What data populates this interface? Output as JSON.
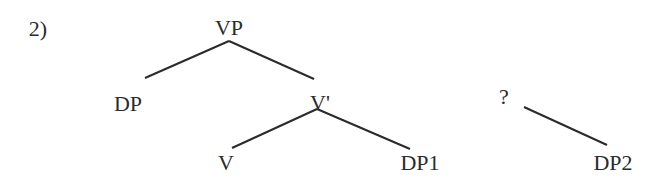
{
  "example_number": "2)",
  "tree": {
    "nodes": [
      {
        "id": "VP",
        "label": "VP",
        "x": 229,
        "y": 28
      },
      {
        "id": "DP",
        "label": "DP",
        "x": 128,
        "y": 104
      },
      {
        "id": "Vbar",
        "label": "V'",
        "x": 320,
        "y": 103
      },
      {
        "id": "V",
        "label": "V",
        "x": 226,
        "y": 163
      },
      {
        "id": "DP1",
        "label": "DP1",
        "x": 420,
        "y": 163
      },
      {
        "id": "Q",
        "label": "?",
        "x": 504,
        "y": 97
      },
      {
        "id": "DP2",
        "label": "DP2",
        "x": 613,
        "y": 163
      }
    ],
    "edges": [
      {
        "from": "VP",
        "to": "DP",
        "x1": 229,
        "y1": 41,
        "x2": 145,
        "y2": 78
      },
      {
        "from": "VP",
        "to": "Vbar",
        "x1": 229,
        "y1": 41,
        "x2": 314,
        "y2": 79
      },
      {
        "from": "Vbar",
        "to": "V",
        "x1": 317,
        "y1": 109,
        "x2": 232,
        "y2": 148
      },
      {
        "from": "Vbar",
        "to": "DP1",
        "x1": 317,
        "y1": 109,
        "x2": 410,
        "y2": 149
      },
      {
        "from": "Q",
        "to": "DP2",
        "x1": 524,
        "y1": 107,
        "x2": 607,
        "y2": 145
      }
    ]
  },
  "colors": {
    "line": "#2b2b2b",
    "text": "#2b2b2b",
    "background": "#ffffff"
  }
}
